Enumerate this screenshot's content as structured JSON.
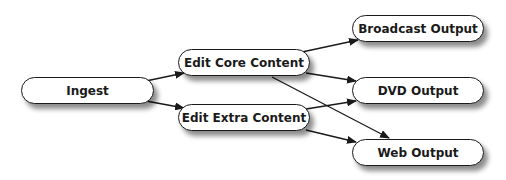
{
  "diagram": {
    "type": "flowchart",
    "nodes": [
      {
        "id": "ingest",
        "label": "Ingest"
      },
      {
        "id": "edit_core",
        "label": "Edit Core Content"
      },
      {
        "id": "edit_extra",
        "label": "Edit Extra Content"
      },
      {
        "id": "broadcast",
        "label": "Broadcast Output"
      },
      {
        "id": "dvd",
        "label": "DVD Output"
      },
      {
        "id": "web",
        "label": "Web Output"
      }
    ],
    "edges": [
      {
        "from": "ingest",
        "to": "edit_core"
      },
      {
        "from": "ingest",
        "to": "edit_extra"
      },
      {
        "from": "edit_core",
        "to": "broadcast"
      },
      {
        "from": "edit_core",
        "to": "dvd"
      },
      {
        "from": "edit_core",
        "to": "web"
      },
      {
        "from": "edit_extra",
        "to": "dvd"
      },
      {
        "from": "edit_extra",
        "to": "web"
      }
    ],
    "colors": {
      "stroke": "#1a1a1a",
      "fill": "#ffffff"
    }
  }
}
